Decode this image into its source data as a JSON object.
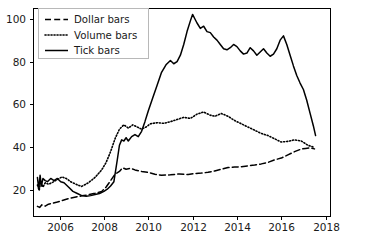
{
  "chart_data": {
    "type": "line",
    "title": "",
    "xlabel": "",
    "ylabel": "",
    "xlim": [
      2004.8,
      2018.2
    ],
    "ylim": [
      8,
      105
    ],
    "xticks": [
      2006,
      2008,
      2010,
      2012,
      2014,
      2016,
      2018
    ],
    "xticklabels": [
      "2006",
      "2008",
      "2010",
      "2012",
      "2014",
      "2016",
      "2018"
    ],
    "yticks": [
      20,
      40,
      60,
      80,
      100
    ],
    "yticklabels": [
      "20",
      "40",
      "60",
      "80",
      "100"
    ],
    "grid": false,
    "legend_position": "upper left",
    "legend_entries": [
      "Dollar bars",
      "Volume bars",
      "Tick bars"
    ],
    "series": [
      {
        "name": "Dollar bars",
        "style": "dashed",
        "color": "#000000",
        "x": [
          2005.0,
          2005.1,
          2005.2,
          2005.35,
          2005.5,
          2005.7,
          2005.9,
          2006.1,
          2006.3,
          2006.5,
          2006.8,
          2007.0,
          2007.3,
          2007.6,
          2007.9,
          2008.1,
          2008.3,
          2008.5,
          2008.7,
          2008.85,
          2009.0,
          2009.2,
          2009.4,
          2009.7,
          2010.0,
          2010.3,
          2010.6,
          2011.0,
          2011.4,
          2011.8,
          2012.1,
          2012.4,
          2012.7,
          2013.0,
          2013.3,
          2013.6,
          2013.9,
          2014.2,
          2014.5,
          2014.8,
          2015.1,
          2015.4,
          2015.7,
          2016.0,
          2016.3,
          2016.6,
          2016.9,
          2017.1,
          2017.3,
          2017.5
        ],
        "y": [
          12.5,
          12.0,
          13.2,
          12.6,
          13.5,
          14.0,
          14.5,
          15.2,
          15.8,
          16.4,
          17.0,
          17.4,
          17.9,
          18.6,
          19.4,
          21.5,
          24.5,
          27.5,
          28.8,
          30.5,
          29.8,
          30.2,
          29.5,
          28.8,
          28.3,
          27.5,
          27.0,
          27.2,
          27.6,
          27.3,
          27.8,
          28.0,
          28.4,
          29.0,
          29.8,
          30.6,
          30.8,
          31.0,
          31.4,
          31.8,
          32.3,
          33.0,
          34.2,
          35.0,
          36.5,
          38.0,
          39.2,
          39.5,
          39.8,
          39.3
        ]
      },
      {
        "name": "Volume bars",
        "style": "dotted",
        "color": "#000000",
        "x": [
          2005.0,
          2005.08,
          2005.15,
          2005.25,
          2005.35,
          2005.5,
          2005.7,
          2005.9,
          2006.1,
          2006.3,
          2006.5,
          2006.8,
          2007.0,
          2007.3,
          2007.6,
          2007.9,
          2008.1,
          2008.3,
          2008.5,
          2008.7,
          2008.9,
          2009.1,
          2009.3,
          2009.5,
          2009.7,
          2009.9,
          2010.1,
          2010.4,
          2010.7,
          2011.0,
          2011.3,
          2011.6,
          2011.9,
          2012.2,
          2012.5,
          2012.8,
          2013.0,
          2013.3,
          2013.6,
          2013.9,
          2014.2,
          2014.5,
          2014.8,
          2015.1,
          2015.4,
          2015.7,
          2016.0,
          2016.3,
          2016.6,
          2016.9,
          2017.2,
          2017.5
        ],
        "y": [
          22.5,
          20.0,
          24.0,
          21.5,
          23.5,
          22.8,
          23.8,
          25.0,
          26.2,
          25.5,
          24.0,
          22.5,
          21.8,
          23.5,
          26.0,
          29.5,
          33.0,
          38.0,
          44.0,
          48.5,
          50.5,
          49.0,
          50.5,
          49.5,
          48.5,
          49.5,
          51.0,
          51.5,
          51.2,
          52.0,
          53.0,
          54.0,
          53.5,
          55.5,
          56.5,
          55.0,
          54.5,
          55.8,
          54.5,
          52.5,
          51.0,
          49.5,
          48.0,
          46.5,
          45.5,
          44.0,
          42.5,
          42.8,
          43.5,
          43.0,
          41.0,
          40.0
        ]
      },
      {
        "name": "Tick bars",
        "style": "solid",
        "color": "#000000",
        "x": [
          2005.0,
          2005.06,
          2005.12,
          2005.18,
          2005.25,
          2005.35,
          2005.45,
          2005.6,
          2005.75,
          2005.9,
          2006.05,
          2006.2,
          2006.4,
          2006.6,
          2006.8,
          2007.0,
          2007.2,
          2007.4,
          2007.6,
          2007.8,
          2008.0,
          2008.15,
          2008.3,
          2008.45,
          2008.6,
          2008.7,
          2008.8,
          2008.9,
          2009.0,
          2009.1,
          2009.25,
          2009.4,
          2009.55,
          2009.7,
          2009.85,
          2010.0,
          2010.2,
          2010.4,
          2010.6,
          2010.8,
          2011.0,
          2011.15,
          2011.3,
          2011.45,
          2011.6,
          2011.75,
          2011.9,
          2012.0,
          2012.1,
          2012.2,
          2012.35,
          2012.5,
          2012.65,
          2012.8,
          2012.95,
          2013.1,
          2013.25,
          2013.4,
          2013.55,
          2013.7,
          2013.85,
          2014.0,
          2014.15,
          2014.3,
          2014.45,
          2014.6,
          2014.75,
          2014.9,
          2015.05,
          2015.2,
          2015.35,
          2015.5,
          2015.65,
          2015.8,
          2015.95,
          2016.1,
          2016.25,
          2016.4,
          2016.55,
          2016.7,
          2016.85,
          2017.0,
          2017.15,
          2017.3,
          2017.45,
          2017.55
        ],
        "y": [
          26.0,
          20.5,
          27.0,
          22.0,
          25.5,
          24.5,
          24.0,
          25.5,
          24.5,
          25.5,
          24.0,
          23.5,
          21.5,
          19.5,
          18.5,
          17.5,
          17.2,
          17.5,
          18.0,
          18.5,
          19.5,
          20.5,
          22.0,
          24.0,
          34.0,
          41.0,
          43.5,
          43.0,
          44.5,
          43.0,
          45.0,
          46.0,
          45.0,
          47.5,
          52.0,
          57.0,
          63.0,
          69.0,
          75.0,
          78.5,
          80.5,
          79.0,
          80.0,
          83.0,
          88.0,
          94.0,
          99.0,
          102.0,
          100.0,
          98.0,
          95.5,
          96.5,
          94.0,
          93.5,
          91.5,
          90.0,
          88.0,
          86.0,
          85.5,
          86.5,
          88.0,
          87.0,
          85.0,
          83.5,
          84.0,
          86.5,
          85.0,
          83.0,
          84.5,
          86.0,
          84.0,
          82.5,
          83.5,
          86.0,
          90.0,
          92.0,
          88.0,
          83.0,
          78.0,
          73.5,
          70.0,
          67.0,
          62.0,
          56.0,
          50.0,
          45.5
        ]
      }
    ]
  },
  "axes": {
    "left_px": 33,
    "right_px": 330,
    "top_px": 8,
    "bottom_px": 216
  }
}
